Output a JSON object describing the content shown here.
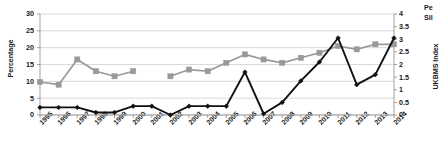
{
  "chart_data": {
    "type": "line",
    "title": "",
    "xlabel": "",
    "ylabel": "Percentage",
    "y2label": "UKBMS Index",
    "grid": true,
    "legend_position": "top-right",
    "categories": [
      "1995",
      "1996",
      "1997",
      "1998",
      "1999",
      "2000",
      "2001",
      "2002",
      "2003",
      "2004",
      "2005",
      "2006",
      "2007",
      "2008",
      "2009",
      "2010",
      "2011",
      "2012",
      "2013",
      "2014"
    ],
    "ylim": [
      0,
      30
    ],
    "y_ticks": [
      0,
      5,
      10,
      15,
      20,
      25,
      30
    ],
    "y2lim": [
      0,
      4
    ],
    "y2_ticks": [
      0,
      0.5,
      1,
      1.5,
      2,
      2.5,
      3,
      3.5,
      4
    ],
    "series": [
      {
        "name": "Pe",
        "axis": "left",
        "color": "#999999",
        "marker": "square",
        "values": [
          9.8,
          9.0,
          16.5,
          13.0,
          11.5,
          13.0,
          null,
          11.5,
          13.5,
          13.0,
          15.5,
          18.0,
          16.5,
          15.5,
          17.0,
          18.5,
          20.5,
          19.5,
          21.0,
          21.0
        ]
      },
      {
        "name": "Sil",
        "axis": "right",
        "color": "#111111",
        "marker": "diamond",
        "values": [
          0.3,
          0.3,
          0.3,
          0.1,
          0.1,
          0.35,
          0.35,
          0.0,
          0.35,
          0.35,
          0.35,
          1.7,
          0.05,
          0.5,
          1.35,
          2.1,
          3.05,
          1.2,
          1.6,
          3.05
        ]
      }
    ]
  },
  "axes": {
    "left_title": "Percentage",
    "right_title": "UKBMS Index",
    "left_ticks": [
      "30",
      "25",
      "20",
      "15",
      "10",
      "5",
      "0"
    ],
    "right_ticks": [
      "4",
      "3.5",
      "3",
      "2.5",
      "2",
      "1.5",
      "1",
      "0.5",
      "0"
    ],
    "x_ticks": [
      "1995",
      "1996",
      "1997",
      "1998",
      "1999",
      "2000",
      "2001",
      "2002",
      "2003",
      "2004",
      "2005",
      "2006",
      "2007",
      "2008",
      "2009",
      "2010",
      "2011",
      "2012",
      "2013",
      "2014"
    ]
  },
  "legend": {
    "entries": [
      {
        "label": "Pe",
        "color": "#999999"
      },
      {
        "label": "Sil",
        "color": "#111111"
      }
    ]
  }
}
